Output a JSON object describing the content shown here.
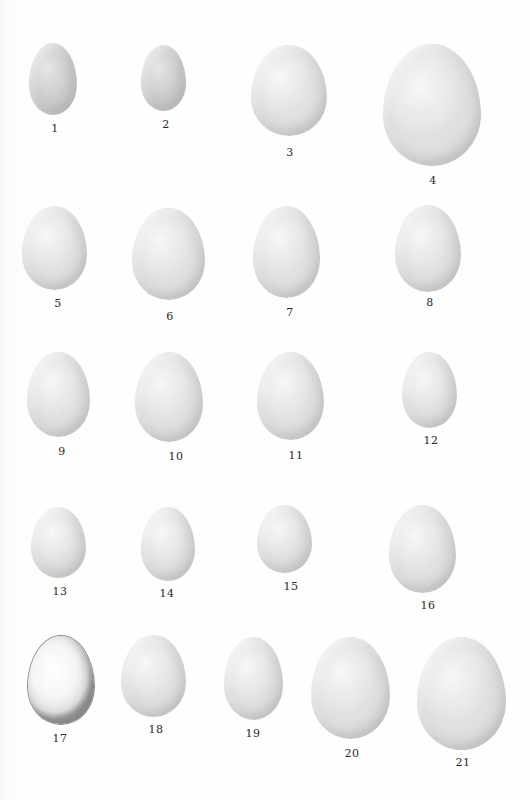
{
  "plate": {
    "background": "#fdfdfd",
    "eggs": [
      {
        "label": "1",
        "x": 29,
        "y": 43,
        "w": 48,
        "h": 72,
        "lx": 55,
        "ly": 128,
        "style": "grey"
      },
      {
        "label": "2",
        "x": 141,
        "y": 45,
        "w": 45,
        "h": 66,
        "lx": 166,
        "ly": 124,
        "style": "grey"
      },
      {
        "label": "3",
        "x": 251,
        "y": 45,
        "w": 76,
        "h": 91,
        "lx": 290,
        "ly": 152,
        "style": ""
      },
      {
        "label": "4",
        "x": 383,
        "y": 44,
        "w": 98,
        "h": 122,
        "lx": 433,
        "ly": 180,
        "style": ""
      },
      {
        "label": "5",
        "x": 22,
        "y": 206,
        "w": 65,
        "h": 84,
        "lx": 58,
        "ly": 303,
        "style": ""
      },
      {
        "label": "6",
        "x": 132,
        "y": 208,
        "w": 73,
        "h": 92,
        "lx": 170,
        "ly": 316,
        "style": ""
      },
      {
        "label": "7",
        "x": 253,
        "y": 206,
        "w": 67,
        "h": 92,
        "lx": 290,
        "ly": 312,
        "style": ""
      },
      {
        "label": "8",
        "x": 395,
        "y": 205,
        "w": 66,
        "h": 87,
        "lx": 430,
        "ly": 302,
        "style": ""
      },
      {
        "label": "9",
        "x": 27,
        "y": 352,
        "w": 63,
        "h": 85,
        "lx": 62,
        "ly": 451,
        "style": ""
      },
      {
        "label": "10",
        "x": 135,
        "y": 352,
        "w": 68,
        "h": 90,
        "lx": 176,
        "ly": 456,
        "style": ""
      },
      {
        "label": "11",
        "x": 257,
        "y": 352,
        "w": 67,
        "h": 88,
        "lx": 296,
        "ly": 455,
        "style": ""
      },
      {
        "label": "12",
        "x": 402,
        "y": 352,
        "w": 55,
        "h": 76,
        "lx": 431,
        "ly": 440,
        "style": ""
      },
      {
        "label": "13",
        "x": 31,
        "y": 507,
        "w": 55,
        "h": 71,
        "lx": 60,
        "ly": 591,
        "style": ""
      },
      {
        "label": "14",
        "x": 141,
        "y": 507,
        "w": 54,
        "h": 74,
        "lx": 167,
        "ly": 593,
        "style": ""
      },
      {
        "label": "15",
        "x": 257,
        "y": 505,
        "w": 55,
        "h": 68,
        "lx": 291,
        "ly": 586,
        "style": ""
      },
      {
        "label": "16",
        "x": 389,
        "y": 505,
        "w": 67,
        "h": 88,
        "lx": 428,
        "ly": 605,
        "style": ""
      },
      {
        "label": "17",
        "x": 28,
        "y": 636,
        "w": 66,
        "h": 88,
        "lx": 60,
        "ly": 738,
        "style": "outlined"
      },
      {
        "label": "18",
        "x": 121,
        "y": 635,
        "w": 65,
        "h": 82,
        "lx": 156,
        "ly": 729,
        "style": ""
      },
      {
        "label": "19",
        "x": 224,
        "y": 637,
        "w": 59,
        "h": 83,
        "lx": 253,
        "ly": 733,
        "style": ""
      },
      {
        "label": "20",
        "x": 311,
        "y": 637,
        "w": 79,
        "h": 102,
        "lx": 352,
        "ly": 753,
        "style": ""
      },
      {
        "label": "21",
        "x": 417,
        "y": 637,
        "w": 89,
        "h": 113,
        "lx": 463,
        "ly": 762,
        "style": ""
      }
    ]
  }
}
